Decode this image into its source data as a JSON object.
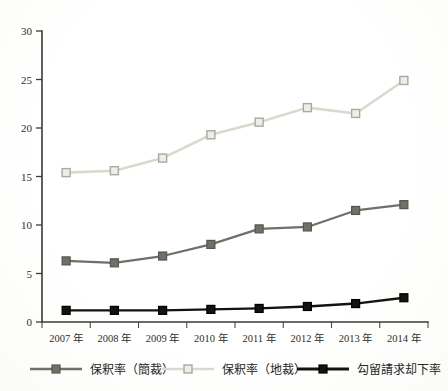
{
  "chart_data": {
    "type": "line",
    "title": "",
    "xlabel": "",
    "ylabel": "",
    "ylim": [
      0,
      30
    ],
    "yticks": [
      0,
      5,
      10,
      15,
      20,
      25,
      30
    ],
    "grid": false,
    "legend_position": "bottom",
    "categories": [
      "2007 年",
      "2008 年",
      "2009 年",
      "2010 年",
      "2011 年",
      "2012 年",
      "2013 年",
      "2014 年"
    ],
    "series": [
      {
        "name": "保釈率（簡裁）",
        "color": "#6f7068",
        "marker": "square-filled",
        "values": [
          6.3,
          6.1,
          6.8,
          8.0,
          9.6,
          9.8,
          11.5,
          12.1
        ]
      },
      {
        "name": "保釈率（地裁）",
        "color": "#d9dacf",
        "marker": "square-open",
        "values": [
          15.4,
          15.6,
          16.9,
          19.3,
          20.6,
          22.1,
          21.5,
          24.9
        ]
      },
      {
        "name": "勾留請求却下率",
        "color": "#16130e",
        "marker": "square-filled",
        "values": [
          1.2,
          1.2,
          1.2,
          1.3,
          1.4,
          1.6,
          1.9,
          2.5
        ]
      }
    ]
  },
  "axes": {
    "y_tick_labels": [
      "30",
      "25",
      "20",
      "15",
      "10",
      "5",
      "0"
    ],
    "x_tick_labels": [
      "2007 年",
      "2008 年",
      "2009 年",
      "2010 年",
      "2011 年",
      "2012 年",
      "2013 年",
      "2014 年"
    ]
  },
  "legend": {
    "items": [
      {
        "label": "保釈率（簡裁）",
        "color": "#6f7068",
        "marker": "square-filled"
      },
      {
        "label": "保釈率（地裁）",
        "color": "#d9dacf",
        "marker": "square-open"
      },
      {
        "label": "勾留請求却下率",
        "color": "#16130e",
        "marker": "square-filled"
      }
    ]
  },
  "colors": {
    "axis": "#3b3b35",
    "text": "#2b2b28",
    "series_kansai": "#6f7068",
    "series_chisai": "#d9dacf",
    "series_kouryu": "#16130e",
    "background": "#ffffff"
  }
}
